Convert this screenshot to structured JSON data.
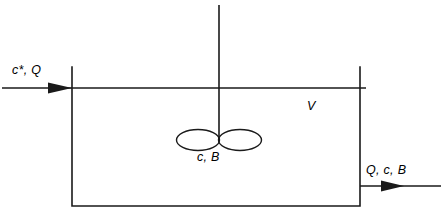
{
  "diagram": {
    "kind": "stirred-tank-reactor-schematic",
    "stroke_color": "#1a1a1a",
    "background_color": "#ffffff",
    "labels": {
      "inlet": "c*, Q",
      "volume": "V",
      "contents": "c, B",
      "outlet": "Q, c, B"
    },
    "icons": {
      "inlet_arrow": "arrow-right-icon",
      "outlet_arrow": "arrow-right-icon",
      "impeller": "impeller-icon",
      "shaft": "shaft-icon"
    },
    "geometry": {
      "tank_left_x": 72,
      "tank_right_x": 360,
      "tank_top_y": 67,
      "tank_bottom_y": 206,
      "liquid_surface_y": 88,
      "shaft_x": 219,
      "shaft_top_y": 5,
      "impeller_center_y": 140,
      "impeller_blade_rx": 21,
      "impeller_blade_ry": 10,
      "inlet_arrow_start_x": 2,
      "inlet_arrow_end_x": 74,
      "inlet_arrow_y": 88,
      "outlet_arrow_start_x": 360,
      "outlet_arrow_end_x": 441,
      "outlet_arrow_y": 186
    }
  }
}
